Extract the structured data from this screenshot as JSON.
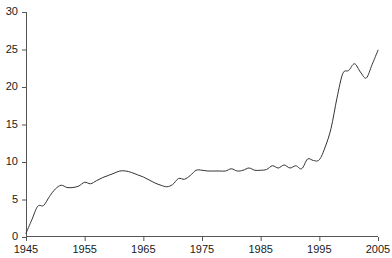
{
  "chart_data": {
    "type": "line",
    "title": "",
    "subtitle": "",
    "xlabel": "",
    "ylabel": "",
    "xlim": [
      1945,
      2005
    ],
    "ylim": [
      0,
      30
    ],
    "xticks": [
      1945,
      1955,
      1965,
      1975,
      1985,
      1995,
      2005
    ],
    "yticks": [
      0,
      5,
      10,
      15,
      20,
      25,
      30
    ],
    "xtick_labels": [
      "1945",
      "1955",
      "1965",
      "1975",
      "1985",
      "1995",
      "2005"
    ],
    "ytick_labels": [
      "0",
      "5",
      "10",
      "15",
      "20",
      "25",
      "30"
    ],
    "grid": false,
    "legend": null,
    "legend_position": "none",
    "line_color": "#333333",
    "line_width": 1,
    "axis_color": "#555555",
    "background_color": "#ffffff",
    "series": [
      {
        "name": "series-1",
        "x": [
          1945,
          1946,
          1947,
          1948,
          1949,
          1950,
          1951,
          1952,
          1953,
          1954,
          1955,
          1956,
          1957,
          1958,
          1959,
          1960,
          1961,
          1962,
          1963,
          1964,
          1965,
          1966,
          1967,
          1968,
          1969,
          1970,
          1971,
          1972,
          1973,
          1974,
          1975,
          1976,
          1977,
          1978,
          1979,
          1980,
          1981,
          1982,
          1983,
          1984,
          1985,
          1986,
          1987,
          1988,
          1989,
          1990,
          1991,
          1992,
          1993,
          1994,
          1995,
          1996,
          1997,
          1998,
          1999,
          2000,
          2001,
          2002,
          2003,
          2004,
          2005
        ],
        "values": [
          0.5,
          2.3,
          4.1,
          4.2,
          5.4,
          6.4,
          6.9,
          6.6,
          6.6,
          6.8,
          7.3,
          7.1,
          7.5,
          7.9,
          8.2,
          8.5,
          8.8,
          8.8,
          8.6,
          8.3,
          8.0,
          7.6,
          7.2,
          6.9,
          6.7,
          7.0,
          7.8,
          7.7,
          8.2,
          8.9,
          8.9,
          8.8,
          8.8,
          8.8,
          8.8,
          9.1,
          8.8,
          8.9,
          9.2,
          8.9,
          8.9,
          9.0,
          9.5,
          9.2,
          9.6,
          9.2,
          9.5,
          9.1,
          10.4,
          10.2,
          10.3,
          12.0,
          14.5,
          18.5,
          21.8,
          22.2,
          23.1,
          22.0,
          21.2,
          23.0,
          24.9
        ]
      }
    ]
  },
  "axes": {
    "x_axis_name": "x-axis",
    "y_axis_name": "y-axis"
  }
}
